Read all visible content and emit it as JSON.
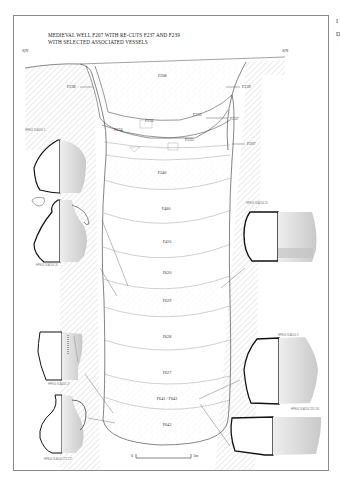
{
  "diagram": {
    "title_line1": "MEDIEVAL WELL F207 WITH RE-CUTS F237 AND F239",
    "title_line2": "WITH SELECTED ASSOCIATED VESSELS",
    "section_marker_left": "S|N",
    "section_marker_right": "S|N",
    "side_text": [
      "I",
      "D"
    ],
    "feature_labels": {
      "f208": "F208",
      "f238": "F238",
      "f239": "F239",
      "f233": "F233",
      "f232": "F232",
      "f237": "F237",
      "f234": "F234",
      "f235": "F235",
      "f207": "F207"
    },
    "layers": [
      "F240",
      "F400",
      "F410",
      "F620",
      "F629",
      "F628",
      "F627",
      "F641 / F642",
      "F643"
    ],
    "scale_bar": {
      "start": "0",
      "end": "1m"
    },
    "vessels": [
      {
        "position": "upper-left",
        "label": "HPE04 SLA204 5"
      },
      {
        "position": "middle-left",
        "label": "HPE04 SLA204 26"
      },
      {
        "position": "middle-right",
        "label": "HPE04 SLA204 24"
      },
      {
        "position": "lower-left-1",
        "label": "HPE04 SLA204 27"
      },
      {
        "position": "lower-left-2",
        "label": "HPE04 SLA204 273 272"
      },
      {
        "position": "lower-right-1",
        "label": "HPE04 SLA204 3"
      },
      {
        "position": "lower-right-2",
        "label": "HPE04 SLA204 233 244"
      }
    ],
    "colors": {
      "line": "#333333",
      "hatch": "#bdbdbd",
      "frame": "#8a8a8a",
      "pottery_fill": "#d8d8d8",
      "profile": "#111111"
    }
  }
}
